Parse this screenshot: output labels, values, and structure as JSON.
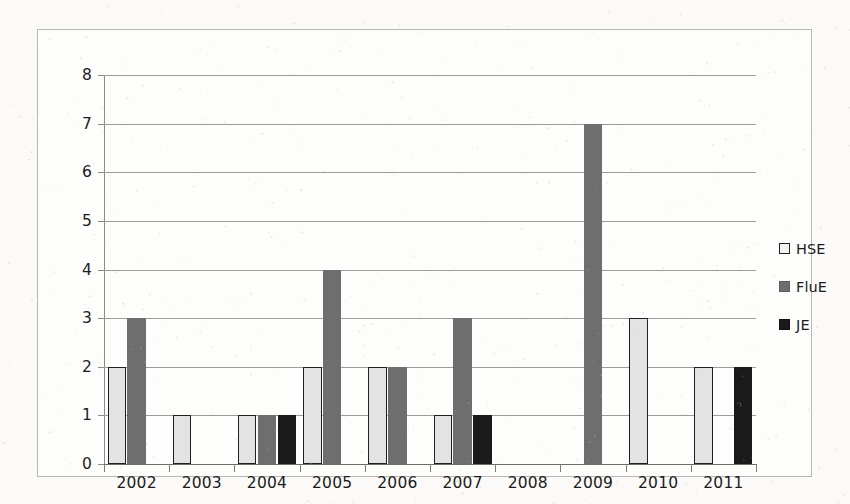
{
  "chart_data": {
    "type": "bar",
    "title": "",
    "subtitle": "",
    "xlabel": "",
    "ylabel": "",
    "categories": [
      "2002",
      "2003",
      "2004",
      "2005",
      "2006",
      "2007",
      "2008",
      "2009",
      "2010",
      "2011"
    ],
    "series": [
      {
        "name": "HSE",
        "color": "#e3e3e3",
        "values": [
          2,
          1,
          1,
          2,
          2,
          1,
          0,
          0,
          3,
          2
        ]
      },
      {
        "name": "FluE",
        "color": "#6e6e6e",
        "values": [
          3,
          0,
          1,
          4,
          2,
          3,
          0,
          7,
          0,
          0
        ]
      },
      {
        "name": "JE",
        "color": "#1a1a1a",
        "values": [
          0,
          0,
          1,
          0,
          0,
          1,
          0,
          0,
          0,
          2
        ]
      }
    ],
    "ylim": [
      0,
      8
    ],
    "ytick_step": 1,
    "yticks": [
      "0",
      "1",
      "2",
      "3",
      "4",
      "5",
      "6",
      "7",
      "8"
    ],
    "grid": true,
    "grid_axis": "y",
    "legend_position": "right",
    "bar_group_gap": true
  },
  "legend": {
    "items": [
      {
        "label": "HSE",
        "swatch": "square-light-outlined"
      },
      {
        "label": "FluE",
        "swatch": "square-mid-gray"
      },
      {
        "label": "JE",
        "swatch": "square-black"
      }
    ]
  },
  "colors": {
    "page_background": "#fbfaf8",
    "plot_background": "#fdfdfc",
    "frame_border": "#b9b7b4",
    "gridline": "#9d9b99",
    "axis_line": "#6d6b69",
    "text": "#1c1c1c",
    "series_hse": "#e3e3e3",
    "series_hse_border": "#1f1f1f",
    "series_flue": "#6e6e6e",
    "series_je": "#1a1a1a"
  }
}
